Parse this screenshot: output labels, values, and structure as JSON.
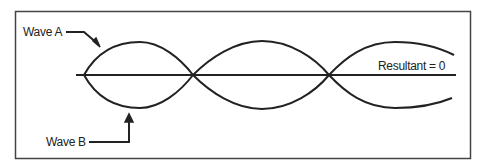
{
  "diagram": {
    "labels": {
      "wave_a": "Wave A",
      "wave_b": "Wave B",
      "resultant": "Resultant = 0"
    },
    "colors": {
      "stroke": "#222222",
      "frame": "#444444",
      "background": "#ffffff"
    }
  }
}
